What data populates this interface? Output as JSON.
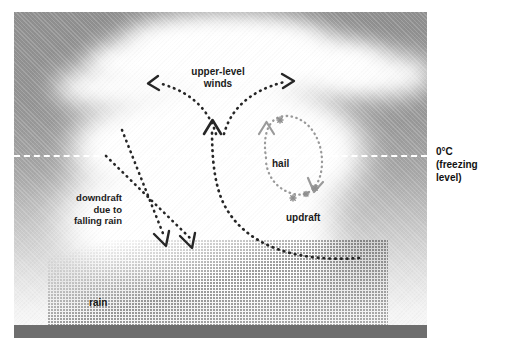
{
  "figure": {
    "type": "thunderstorm-cross-section-diagram",
    "background_color": "#ffffff",
    "sky_color_top": "#8f8f8f",
    "cloud_color": "#ffffff",
    "ground_color": "#6e6e6e",
    "arrow_dark_color": "#262626",
    "arrow_hail_color": "#9a9a9a",
    "freezing_line_color": "#ffffff"
  },
  "labels": {
    "upper_level_winds": "upper-level\nwinds",
    "upper_level_winds_line1": "upper-level",
    "upper_level_winds_line2": "winds",
    "hail": "hail",
    "updraft": "updraft",
    "downdraft_line1": "downdraft",
    "downdraft_line2": "due to",
    "downdraft_line3": "falling rain",
    "rain": "rain",
    "freezing_line1": "0°C",
    "freezing_line2": "(freezing",
    "freezing_line3": "level)"
  },
  "annotations": {
    "arrows": [
      {
        "name": "upper-level-wind-left",
        "direction": "left",
        "style": "dotted",
        "color": "#262626"
      },
      {
        "name": "upper-level-wind-right",
        "direction": "right",
        "style": "dotted",
        "color": "#262626"
      },
      {
        "name": "updraft-arrow",
        "direction": "up",
        "style": "dotted",
        "color": "#262626"
      },
      {
        "name": "downdraft-arrow-left",
        "direction": "down",
        "style": "dotted",
        "color": "#262626"
      },
      {
        "name": "downdraft-arrow-right",
        "direction": "down",
        "style": "dotted",
        "color": "#262626"
      },
      {
        "name": "hail-circulation-up",
        "direction": "up",
        "style": "dotted",
        "color": "#9a9a9a"
      },
      {
        "name": "hail-circulation-down",
        "direction": "down",
        "style": "dotted",
        "color": "#9a9a9a"
      }
    ],
    "hailstones_count": 4
  }
}
